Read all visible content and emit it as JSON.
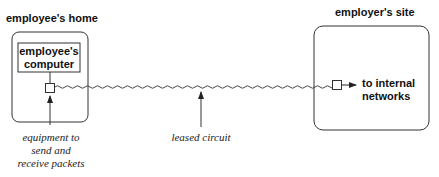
{
  "diagram": {
    "home": {
      "title": "employee's home",
      "computer_line1": "employee's",
      "computer_line2": "computer"
    },
    "employer": {
      "title": "employer's site",
      "dest_line1": "to internal",
      "dest_line2": "networks"
    },
    "annotations": {
      "equipment_line1": "equipment to",
      "equipment_line2": "send and",
      "equipment_line3": "receive packets",
      "circuit": "leased circuit"
    },
    "colors": {
      "line": "#222222",
      "background": "#ffffff"
    }
  }
}
